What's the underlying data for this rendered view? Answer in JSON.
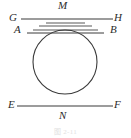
{
  "figure": {
    "type": "geometry-diagram",
    "caption": "图 2-11",
    "stroke_color": "#3a3a3a",
    "label_color": "#2b2b2b",
    "background_color": "#ffffff",
    "circle": {
      "cx": 65,
      "cy": 62,
      "r": 32
    },
    "labels": [
      {
        "id": "G",
        "text": "G",
        "x": 9,
        "y": 13
      },
      {
        "id": "M",
        "text": "M",
        "x": 59,
        "y": 1
      },
      {
        "id": "H",
        "text": "H",
        "x": 114,
        "y": 13
      },
      {
        "id": "A",
        "text": "A",
        "x": 14,
        "y": 25
      },
      {
        "id": "B",
        "text": "B",
        "x": 109,
        "y": 25
      },
      {
        "id": "E",
        "text": "E",
        "x": 8,
        "y": 99
      },
      {
        "id": "N",
        "text": "N",
        "x": 59,
        "y": 112
      },
      {
        "id": "F",
        "text": "F",
        "x": 113,
        "y": 99
      }
    ],
    "lines": [
      {
        "id": "GH",
        "name": "tangent-line-gh",
        "x1": 21,
        "y1": 19,
        "x2": 113,
        "y2": 19
      },
      {
        "id": "EF",
        "name": "tangent-line-ef",
        "x1": 17,
        "y1": 106,
        "x2": 113,
        "y2": 106
      }
    ],
    "chords": [
      {
        "id": "c1",
        "name": "chord-1",
        "x1": 46,
        "y1": 23,
        "x2": 85,
        "y2": 23
      },
      {
        "id": "c2",
        "name": "chord-2",
        "x1": 39,
        "y1": 26,
        "x2": 92,
        "y2": 26
      },
      {
        "id": "c3",
        "name": "chord-3",
        "x1": 33,
        "y1": 30,
        "x2": 98,
        "y2": 30
      },
      {
        "id": "AB",
        "name": "chord-ab",
        "x1": 27,
        "y1": 33,
        "x2": 104,
        "y2": 33
      }
    ]
  }
}
